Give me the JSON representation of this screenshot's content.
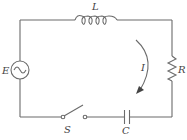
{
  "diagram": {
    "type": "RLC series circuit",
    "components": {
      "inductor": {
        "label": "L"
      },
      "source": {
        "label": "E",
        "kind": "AC source"
      },
      "resistor": {
        "label": "R"
      },
      "switch": {
        "label": "S",
        "state": "open"
      },
      "capacitor": {
        "label": "C"
      },
      "current": {
        "label": "I",
        "direction": "clockwise"
      }
    }
  }
}
